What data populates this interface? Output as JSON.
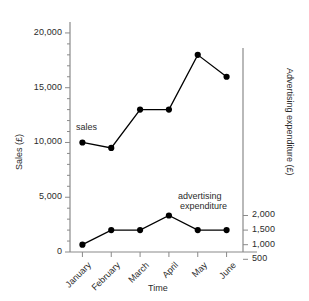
{
  "chart_data": {
    "type": "line",
    "title": "",
    "xlabel": "Time",
    "ylabel": "Sales (£)",
    "y2label": "Advertising expenditure (£)",
    "categories": [
      "January",
      "February",
      "March",
      "April",
      "May",
      "June"
    ],
    "series": [
      {
        "name": "sales",
        "axis": "left",
        "values": [
          10000,
          9500,
          13000,
          13000,
          18000,
          16000
        ]
      },
      {
        "name": "advertising expenditure",
        "axis": "right",
        "values": [
          1000,
          1500,
          1500,
          2000,
          1500,
          1500
        ]
      }
    ],
    "ylim": [
      0,
      21000
    ],
    "yticks": [
      0,
      5000,
      10000,
      15000,
      20000
    ],
    "ytick_labels": [
      "0",
      "5,000",
      "10,000",
      "15,000",
      "20,000"
    ],
    "y2ticks": [
      500,
      1000,
      1500,
      2000
    ],
    "y2tick_labels": [
      "500",
      "1,000",
      "1,500",
      "2,000"
    ],
    "grid": false,
    "legend": "inline-annotations",
    "marker": "filled-circle",
    "line_color": "#000000",
    "axis_color": "#8a8a8a"
  },
  "annotations": {
    "sales_label": "sales",
    "advertising_label_line1": "advertising",
    "advertising_label_line2": "expenditure"
  },
  "axis": {
    "left_title": "Sales (£)",
    "right_title": "Advertising expenditure (£)",
    "bottom_title": "Time"
  }
}
